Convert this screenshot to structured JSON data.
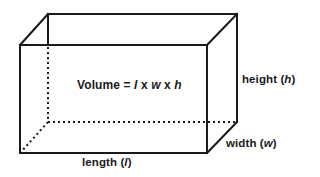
{
  "diagram": {
    "shape": "rectangular-prism",
    "stroke_color": "#1a1a1a",
    "background_color": "#ffffff",
    "formula": {
      "prefix": "Volume = ",
      "l": "l",
      "x1": " x ",
      "w": "w",
      "x2": " x ",
      "h": "h"
    },
    "labels": {
      "height": {
        "text": "height (",
        "var": "h",
        "close": ")"
      },
      "width": {
        "text": "width (",
        "var": "w",
        "close": ")"
      },
      "length": {
        "text": "length (",
        "var": "l",
        "close": ")"
      }
    },
    "vertices": {
      "front_top_left": [
        20,
        45
      ],
      "front_top_right": [
        207,
        45
      ],
      "front_bottom_left": [
        20,
        153
      ],
      "front_bottom_right": [
        207,
        153
      ],
      "back_top_left": [
        48,
        14
      ],
      "back_top_right": [
        237,
        14
      ],
      "back_bottom_right": [
        237,
        122
      ],
      "back_bottom_left_hidden": [
        48,
        122
      ]
    }
  }
}
